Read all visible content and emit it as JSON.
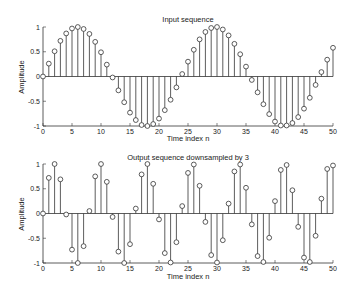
{
  "chart_data": [
    {
      "type": "stem",
      "title": "Input sequence",
      "xlabel": "Time index n",
      "ylabel": "Amplitude",
      "xlim": [
        0,
        50
      ],
      "ylim": [
        -1,
        1
      ],
      "xticks": [
        0,
        5,
        10,
        15,
        20,
        25,
        30,
        35,
        40,
        45,
        50
      ],
      "yticks": [
        -1,
        -0.5,
        0,
        0.5,
        1
      ],
      "ytick_labels": [
        "-1",
        "-0.5",
        "0",
        "0.5",
        "1"
      ],
      "grid": false,
      "x": [
        0,
        1,
        2,
        3,
        4,
        5,
        6,
        7,
        8,
        9,
        10,
        11,
        12,
        13,
        14,
        15,
        16,
        17,
        18,
        19,
        20,
        21,
        22,
        23,
        24,
        25,
        26,
        27,
        28,
        29,
        30,
        31,
        32,
        33,
        34,
        35,
        36,
        37,
        38,
        39,
        40,
        41,
        42,
        43,
        44,
        45,
        46,
        47,
        48,
        49,
        50
      ],
      "values": [
        0.0,
        0.26,
        0.51,
        0.72,
        0.87,
        0.97,
        1.0,
        0.96,
        0.86,
        0.7,
        0.49,
        0.24,
        -0.02,
        -0.28,
        -0.52,
        -0.73,
        -0.88,
        -0.98,
        -1.0,
        -0.96,
        -0.85,
        -0.68,
        -0.47,
        -0.22,
        0.05,
        0.3,
        0.54,
        0.75,
        0.9,
        0.98,
        1.0,
        0.95,
        0.83,
        0.66,
        0.45,
        0.2,
        -0.07,
        -0.32,
        -0.56,
        -0.76,
        -0.91,
        -0.99,
        -0.99,
        -0.94,
        -0.82,
        -0.65,
        -0.43,
        -0.17,
        0.09,
        0.34,
        0.58
      ]
    },
    {
      "type": "stem",
      "title": "Output sequence downsampled by 3",
      "xlabel": "Time index n",
      "ylabel": "Amplitude",
      "xlim": [
        0,
        50
      ],
      "ylim": [
        -1,
        1
      ],
      "xticks": [
        0,
        5,
        10,
        15,
        20,
        25,
        30,
        35,
        40,
        45,
        50
      ],
      "yticks": [
        -1,
        -0.5,
        0,
        0.5,
        1
      ],
      "ytick_labels": [
        "-1",
        "-0.5",
        "0",
        "0.5",
        "1"
      ],
      "grid": false,
      "x": [
        0,
        1,
        2,
        3,
        4,
        5,
        6,
        7,
        8,
        9,
        10,
        11,
        12,
        13,
        14,
        15,
        16,
        17,
        18,
        19,
        20,
        21,
        22,
        23,
        24,
        25,
        26,
        27,
        28,
        29,
        30,
        31,
        32,
        33,
        34,
        35,
        36,
        37,
        38,
        39,
        40,
        41,
        42,
        43,
        44,
        45,
        46,
        47,
        48,
        49,
        50
      ],
      "values": [
        0.0,
        0.72,
        1.0,
        0.69,
        -0.02,
        -0.73,
        -1.0,
        -0.66,
        0.05,
        0.75,
        1.0,
        0.64,
        -0.07,
        -0.77,
        -1.0,
        -0.62,
        0.1,
        0.79,
        1.0,
        0.6,
        -0.12,
        -0.8,
        -0.99,
        -0.58,
        0.15,
        0.82,
        0.99,
        0.56,
        -0.17,
        -0.84,
        -0.99,
        -0.54,
        0.2,
        0.85,
        0.99,
        0.52,
        -0.22,
        -0.86,
        -0.98,
        -0.49,
        0.25,
        0.88,
        0.98,
        0.47,
        -0.27,
        -0.89,
        -0.98,
        -0.45,
        0.3,
        0.9,
        0.97
      ]
    }
  ],
  "colors": {
    "stem": "#333333",
    "axis": "#333333",
    "marker_fill": "#ffffff"
  }
}
